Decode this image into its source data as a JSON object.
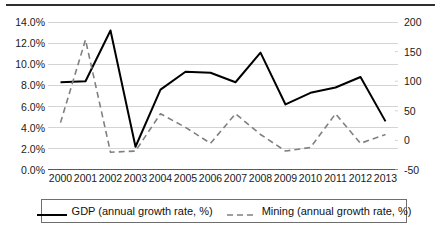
{
  "chart_data": {
    "type": "line",
    "title": "",
    "subtitle": "",
    "xlabel": "",
    "ylabel": "",
    "grid": true,
    "legend_position": "bottom",
    "categories": [
      "2000",
      "2001",
      "2002",
      "2003",
      "2004",
      "2005",
      "2006",
      "2007",
      "2008",
      "2009",
      "2010",
      "2011",
      "2012",
      "2013"
    ],
    "axes": {
      "left": {
        "label": "",
        "ylim": [
          0,
          14
        ],
        "tick_values": [
          0,
          2,
          4,
          6,
          8,
          10,
          12,
          14
        ],
        "tick_labels": [
          "0.0%",
          "2.0%",
          "4.0%",
          "6.0%",
          "8.0%",
          "10.0%",
          "12.0%",
          "14.0%"
        ],
        "unit": "%"
      },
      "right": {
        "label": "",
        "ylim": [
          -50,
          200
        ],
        "tick_values": [
          -50,
          0,
          50,
          100,
          150,
          200
        ],
        "tick_labels": [
          "-50",
          "0",
          "50",
          "100",
          "150",
          "200"
        ],
        "unit": ""
      }
    },
    "series": [
      {
        "name": "GDP (annual growth rate, %)",
        "axis": "left",
        "style": "solid",
        "color": "#000000",
        "values": [
          8.3,
          8.4,
          13.2,
          2.2,
          7.6,
          9.3,
          9.2,
          8.3,
          11.1,
          6.2,
          7.3,
          7.8,
          8.8,
          4.6
        ]
      },
      {
        "name": "Mining (annual growth rate, %)",
        "axis": "right",
        "style": "dashed",
        "color": "#808080",
        "values": [
          30,
          170,
          -20,
          -18,
          45,
          22,
          -5,
          45,
          10,
          -18,
          -12,
          45,
          -5,
          10
        ]
      }
    ]
  },
  "legend": {
    "entries": [
      {
        "label": "GDP (annual growth rate, %)",
        "style": "solid",
        "color": "#000000"
      },
      {
        "label": "Mining (annual growth rate, %)",
        "style": "dashed",
        "color": "#808080"
      }
    ]
  },
  "colors": {
    "gdp_line": "#000000",
    "mining_line": "#808080",
    "gridline": "#d4d4d4",
    "axis": "#595959",
    "top_rule": "#2f2f2f",
    "text": "#1a1a1a",
    "background": "#ffffff"
  }
}
